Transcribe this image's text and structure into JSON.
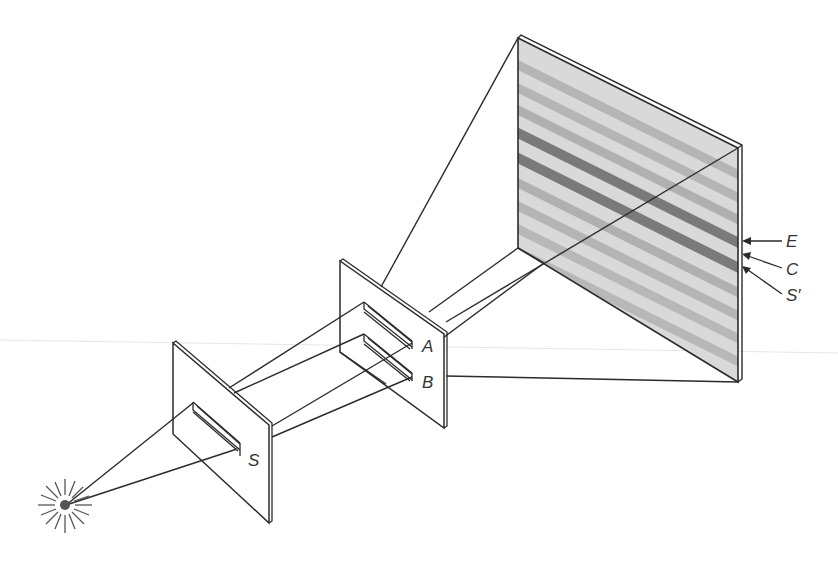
{
  "diagram": {
    "title": "",
    "labels": {
      "source_slit": "S",
      "slit_a": "A",
      "slit_b": "B",
      "fringe_e": "E",
      "fringe_c": "C",
      "fringe_s_prime": "S′"
    },
    "components": [
      {
        "id": "light-source",
        "kind": "point source (starburst)"
      },
      {
        "id": "barrier-1",
        "kind": "single-slit barrier",
        "slit_label": "S"
      },
      {
        "id": "barrier-2",
        "kind": "double-slit barrier",
        "slit_labels": [
          "A",
          "B"
        ]
      },
      {
        "id": "screen",
        "kind": "viewing screen with interference fringes",
        "marked_fringes": [
          "E",
          "C",
          "S′"
        ]
      }
    ],
    "colors": {
      "line": "#2b2b2b",
      "screen_fill": "#d9d9d9",
      "light_fringe": "#b8b8b8",
      "dark_fringe": "#7a7a7a",
      "panel_fill": "#ffffff"
    }
  }
}
